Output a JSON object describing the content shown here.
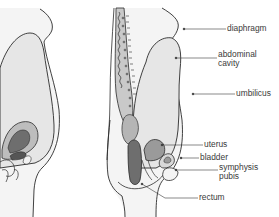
{
  "figure": {
    "type": "anatomical-cross-section",
    "panels": 2
  },
  "labels": [
    {
      "id": "diaphragm",
      "text": "diaphragm",
      "x": 227,
      "y": 24
    },
    {
      "id": "abdominal-cavity",
      "text": "abdominal\ncavity",
      "x": 218,
      "y": 50
    },
    {
      "id": "umbilicus",
      "text": "umbilicus",
      "x": 236,
      "y": 86
    },
    {
      "id": "uterus",
      "text": "uterus",
      "x": 204,
      "y": 139
    },
    {
      "id": "bladder",
      "text": "bladder",
      "x": 200,
      "y": 151
    },
    {
      "id": "symphysis-pubis",
      "text": "symphysis\npubis",
      "x": 219,
      "y": 163
    },
    {
      "id": "rectum",
      "text": "rectum",
      "x": 199,
      "y": 192
    }
  ],
  "colors": {
    "outline": "#2b2b2b",
    "skin_fill": "#f2f2f2",
    "cavity_fill": "#e4e4e4",
    "organ_mid": "#bdbdbd",
    "organ_dark": "#6e6e6e",
    "leader_line": "#3a3a3a",
    "text": "#3a3a3a"
  }
}
